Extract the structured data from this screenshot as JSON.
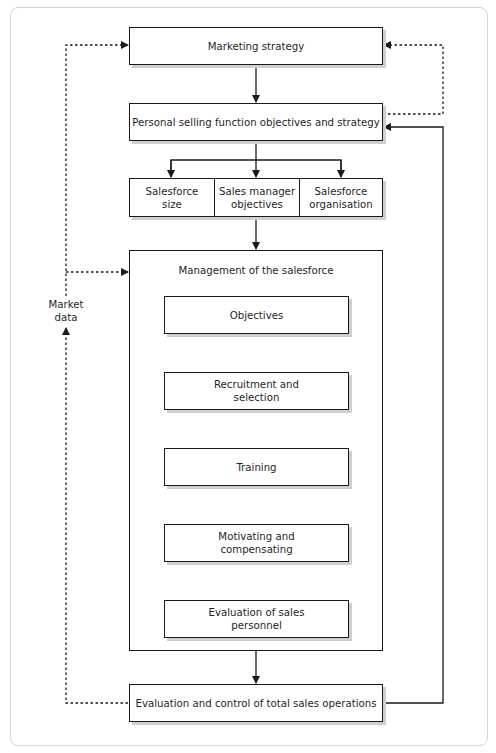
{
  "diagram": {
    "top": {
      "marketing_strategy": "Marketing strategy",
      "personal_selling": "Personal selling function objectives and strategy"
    },
    "branches": [
      {
        "line1": "Salesforce",
        "line2": "size"
      },
      {
        "line1": "Sales manager",
        "line2": "objectives"
      },
      {
        "line1": "Salesforce",
        "line2": "organisation"
      }
    ],
    "management": {
      "title": "Management of the salesforce",
      "steps": [
        {
          "line1": "Objectives",
          "line2": ""
        },
        {
          "line1": "Recruitment and",
          "line2": "selection"
        },
        {
          "line1": "Training",
          "line2": ""
        },
        {
          "line1": "Motivating and",
          "line2": "compensating"
        },
        {
          "line1": "Evaluation of sales",
          "line2": "personnel"
        }
      ]
    },
    "bottom": "Evaluation and control of total sales operations",
    "feedback_label": {
      "line1": "Market",
      "line2": "data"
    },
    "colors": {
      "stroke": "#1a1a1a",
      "shadow": "#cfcfcf",
      "panel_border": "#d6d6d6"
    }
  }
}
